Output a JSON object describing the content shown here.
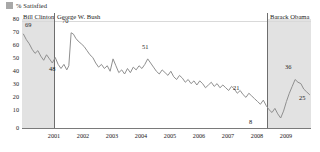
{
  "legend": {
    "swatch_color": "#a8a8a8",
    "label": "% Satisfied"
  },
  "eras": [
    {
      "name": "Bill Clinton",
      "shaded": true,
      "key": "clinton"
    },
    {
      "name": "George W. Bush",
      "shaded": false,
      "key": "bush"
    },
    {
      "name": "Barack Obama",
      "shaded": true,
      "key": "obama"
    }
  ],
  "axes": {
    "y_ticks": [
      "80",
      "70",
      "60",
      "50",
      "40",
      "30",
      "20",
      "10",
      "0"
    ],
    "x_ticks": [
      "2001",
      "2002",
      "2003",
      "2004",
      "2005",
      "2006",
      "2007",
      "2008",
      "2009"
    ],
    "ylim": [
      0,
      80
    ],
    "ylabel": "",
    "xlabel": ""
  },
  "callouts": [
    {
      "text": "69",
      "x": 3.0,
      "y": 73.0
    },
    {
      "text": "48",
      "x": 27.0,
      "y": 41.0
    },
    {
      "text": "70",
      "x": 40.0,
      "y": 76.0
    },
    {
      "text": "51",
      "x": 120.0,
      "y": 57.0
    },
    {
      "text": "21",
      "x": 211.0,
      "y": 27.0
    },
    {
      "text": "8",
      "x": 227.0,
      "y": 2.0
    },
    {
      "text": "36",
      "x": 263.0,
      "y": 42.0
    },
    {
      "text": "25",
      "x": 277.0,
      "y": 20.0
    }
  ],
  "chart_data": {
    "type": "line",
    "title": "",
    "subtitle": "",
    "xlabel": "",
    "ylabel": "",
    "ylim": [
      0,
      80
    ],
    "grid": true,
    "legend_position": "top-left",
    "series_color": "#8f8f8f",
    "series": [
      {
        "name": "% Satisfied",
        "x": [
          2000.05,
          2000.15,
          2000.25,
          2000.35,
          2000.45,
          2000.55,
          2000.65,
          2000.75,
          2000.85,
          2000.95,
          2001.05,
          2001.15,
          2001.25,
          2001.35,
          2001.45,
          2001.55,
          2001.62,
          2001.7,
          2001.78,
          2001.86,
          2001.94,
          2002.05,
          2002.15,
          2002.25,
          2002.35,
          2002.45,
          2002.55,
          2002.65,
          2002.75,
          2002.85,
          2002.95,
          2003.05,
          2003.15,
          2003.25,
          2003.35,
          2003.45,
          2003.55,
          2003.65,
          2003.75,
          2003.85,
          2003.95,
          2004.05,
          2004.15,
          2004.25,
          2004.35,
          2004.45,
          2004.55,
          2004.65,
          2004.75,
          2004.85,
          2004.95,
          2005.05,
          2005.15,
          2005.25,
          2005.35,
          2005.45,
          2005.55,
          2005.65,
          2005.75,
          2005.85,
          2005.95,
          2006.05,
          2006.15,
          2006.25,
          2006.35,
          2006.45,
          2006.55,
          2006.65,
          2006.75,
          2006.85,
          2006.95,
          2007.05,
          2007.15,
          2007.25,
          2007.35,
          2007.45,
          2007.55,
          2007.65,
          2007.75,
          2007.85,
          2007.95,
          2008.05,
          2008.15,
          2008.25,
          2008.35,
          2008.45,
          2008.55,
          2008.65,
          2008.75,
          2008.85,
          2008.95,
          2009.05,
          2009.15,
          2009.25,
          2009.35,
          2009.45,
          2009.55,
          2009.65,
          2009.75,
          2009.85,
          2009.95
        ],
        "values": [
          69,
          65,
          62,
          58,
          55,
          57,
          53,
          50,
          54,
          51,
          48,
          52,
          47,
          44,
          47,
          43,
          46,
          70,
          69,
          66,
          64,
          62,
          60,
          57,
          54,
          52,
          48,
          45,
          47,
          44,
          46,
          42,
          51,
          46,
          41,
          43,
          40,
          44,
          41,
          45,
          43,
          46,
          44,
          47,
          51,
          48,
          45,
          42,
          40,
          43,
          41,
          39,
          42,
          38,
          36,
          39,
          37,
          34,
          36,
          33,
          35,
          32,
          35,
          33,
          30,
          32,
          34,
          31,
          33,
          30,
          32,
          30,
          28,
          31,
          29,
          26,
          28,
          25,
          23,
          26,
          24,
          22,
          20,
          18,
          21,
          17,
          14,
          12,
          15,
          11,
          8,
          13,
          20,
          26,
          31,
          36,
          34,
          33,
          29,
          27,
          25
        ]
      }
    ]
  }
}
